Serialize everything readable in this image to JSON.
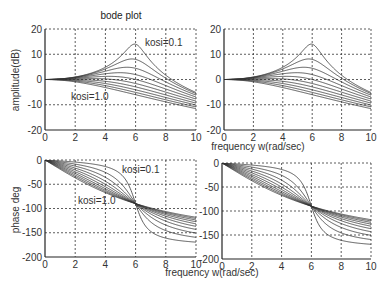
{
  "chart_data": [
    {
      "type": "line",
      "title": "bode plot",
      "xlabel": "",
      "ylabel": "amplitude(dB)",
      "xlim": [
        0,
        10
      ],
      "ylim": [
        -20,
        20
      ],
      "xticks": [
        0,
        2,
        4,
        6,
        8,
        10
      ],
      "yticks": [
        -20,
        -10,
        0,
        10,
        20
      ],
      "grid": true,
      "annotations": [
        {
          "text": "kosi=0.1",
          "x": 7.2,
          "y": 14
        },
        {
          "text": "kosi=1.0",
          "x": 1.6,
          "y": -6
        }
      ],
      "model": "second-order: wn=6, damping kosi 0.1..1.0 step 0.1",
      "x": [
        0,
        2,
        4,
        6,
        8,
        10
      ],
      "series": [
        {
          "name": "kosi=0.1",
          "values": [
            0,
            0.9,
            5.0,
            14.0,
            3.2,
            -4.6
          ]
        },
        {
          "name": "kosi=0.2",
          "values": [
            0,
            0.9,
            4.6,
            8.0,
            2.4,
            -4.9
          ]
        },
        {
          "name": "kosi=0.3",
          "values": [
            0,
            0.7,
            3.8,
            4.4,
            1.3,
            -5.4
          ]
        },
        {
          "name": "kosi=0.4",
          "values": [
            0,
            0.5,
            2.9,
            1.9,
            0.1,
            -6.0
          ]
        },
        {
          "name": "kosi=0.5",
          "values": [
            0,
            0.3,
            1.9,
            0.0,
            -1.1,
            -6.6
          ]
        },
        {
          "name": "kosi=0.6",
          "values": [
            0,
            0.0,
            0.9,
            -1.6,
            -2.2,
            -7.2
          ]
        },
        {
          "name": "kosi=0.7",
          "values": [
            0,
            -0.2,
            -0.1,
            -2.9,
            -3.3,
            -7.8
          ]
        },
        {
          "name": "kosi=0.8",
          "values": [
            0,
            -0.5,
            -1.0,
            -4.1,
            -4.3,
            -8.4
          ]
        },
        {
          "name": "kosi=0.9",
          "values": [
            0,
            -0.8,
            -1.9,
            -5.1,
            -5.2,
            -9.0
          ]
        },
        {
          "name": "kosi=1.0",
          "values": [
            0,
            -0.9,
            -2.8,
            -6.0,
            -6.0,
            -9.5
          ]
        }
      ]
    },
    {
      "type": "line",
      "title": "",
      "xlabel": "frequency w(rad/sec)",
      "ylabel": "",
      "xlim": [
        0,
        10
      ],
      "ylim": [
        -20,
        20
      ],
      "xticks": [
        0,
        2,
        4,
        6,
        8,
        10
      ],
      "yticks": [
        -20,
        -10,
        0,
        10,
        20
      ],
      "grid": true,
      "model": "same as amplitude plot (duplicate panel)"
    },
    {
      "type": "line",
      "title": "",
      "xlabel": "",
      "ylabel": "phase deg",
      "xlim": [
        0,
        10
      ],
      "ylim": [
        -200,
        0
      ],
      "xticks": [
        0,
        2,
        4,
        6,
        8,
        10
      ],
      "yticks": [
        -200,
        -150,
        -100,
        -50,
        0
      ],
      "grid": true,
      "annotations": [
        {
          "text": "kosi=0.1",
          "x": 5.3,
          "y": -20
        },
        {
          "text": "kosi=1.0",
          "x": 2.0,
          "y": -85
        }
      ],
      "x": [
        0,
        2,
        4,
        6,
        8,
        10
      ],
      "series": [
        {
          "name": "kosi=0.1",
          "values": [
            0,
            -1.4,
            -4.6,
            -90,
            -172.3,
            -176.4
          ]
        },
        {
          "name": "kosi=1.0",
          "values": [
            0,
            -36.9,
            -67.4,
            -90,
            -106.3,
            -118.1
          ]
        }
      ]
    },
    {
      "type": "line",
      "title": "",
      "xlabel": "frequency w(rad/sec)",
      "ylabel": "",
      "xlim": [
        0,
        10
      ],
      "ylim": [
        -200,
        0
      ],
      "xticks": [
        0,
        2,
        4,
        6,
        8,
        10
      ],
      "yticks": [
        -200,
        -150,
        -100,
        -50,
        0
      ],
      "grid": true,
      "model": "same as phase plot (duplicate panel)"
    }
  ],
  "system": {
    "wn": 6,
    "kosi": [
      0.1,
      0.2,
      0.3,
      0.4,
      0.5,
      0.6,
      0.7,
      0.8,
      0.9,
      1.0
    ]
  },
  "labels": {
    "title": "bode plot",
    "amp_ylabel": "amplitude(dB)",
    "phase_ylabel": "phase deg",
    "xlabel": "frequency w(rad/sec)",
    "kosi_low": "kosi=0.1",
    "kosi_high": "kosi=1.0"
  },
  "colors": {
    "line": "#333333",
    "axis": "#222222",
    "grid": "#333333",
    "background": "#ffffff"
  }
}
